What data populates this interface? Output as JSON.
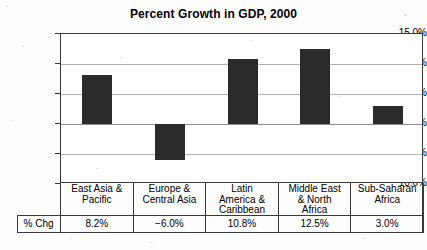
{
  "chart_data": {
    "type": "bar",
    "title": "Percent Growth in GDP, 2000",
    "xlabel": "",
    "ylabel": "",
    "ylim": [
      -10.0,
      15.0
    ],
    "ytick_labels": [
      "15.0%",
      "10.0%",
      "5.0%",
      "0.0%",
      "−5.0%",
      "−10.0%"
    ],
    "ytick_values": [
      15.0,
      10.0,
      5.0,
      0.0,
      -5.0,
      -10.0
    ],
    "grid": true,
    "legend": "none",
    "bar_color": "#2b2b2b",
    "gridline_color": "#b4b4b4",
    "frame_color": "#3a3a3a",
    "categories": [
      [
        "East Asia &",
        "Pacific"
      ],
      [
        "Europe &",
        "Central Asia"
      ],
      [
        "Latin",
        "America &",
        "Caribbean"
      ],
      [
        "Middle East",
        "& North",
        "Africa"
      ],
      [
        "Sub-Saharan",
        "Africa"
      ]
    ],
    "category_names": [
      "East Asia & Pacific",
      "Europe & Central Asia",
      "Latin America & Caribbean",
      "Middle East & North Africa",
      "Sub-Saharan Africa"
    ],
    "values": [
      8.2,
      -6.0,
      10.8,
      12.5,
      3.0
    ],
    "value_labels": [
      "8.2%",
      "−6.0%",
      "10.8%",
      "12.5%",
      "3.0%"
    ],
    "series": [
      {
        "name": "% Chg",
        "values": [
          8.2,
          -6.0,
          10.8,
          12.5,
          3.0
        ]
      }
    ],
    "data_table": {
      "row_label": "% Chg",
      "columns": [
        "East Asia & Pacific",
        "Europe & Central Asia",
        "Latin America & Caribbean",
        "Middle East & North Africa",
        "Sub-Saharan Africa"
      ],
      "values": [
        "8.2%",
        "−6.0%",
        "10.8%",
        "12.5%",
        "3.0%"
      ]
    }
  }
}
